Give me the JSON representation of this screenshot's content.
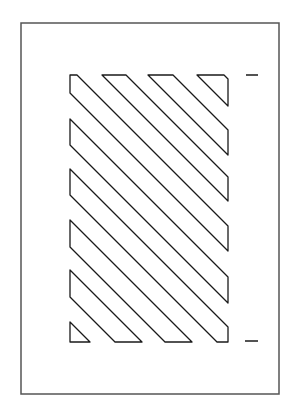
{
  "diagram": {
    "type": "hatched-region-in-frame",
    "colors": {
      "background": "#ffffff",
      "stroke": "#1a1a1a",
      "frame": "#555555"
    },
    "frame": {
      "x": 21,
      "y": 23,
      "width": 258,
      "height": 371
    },
    "hatch_region": {
      "x": 70,
      "y": 75,
      "width": 158,
      "height": 267
    },
    "stripe_count": 8,
    "stripe_angle_deg": 45,
    "dashes": [
      {
        "x1": 246,
        "y1": 75,
        "x2": 258,
        "y2": 75
      },
      {
        "x1": 245,
        "y1": 341,
        "x2": 258,
        "y2": 341
      }
    ]
  }
}
